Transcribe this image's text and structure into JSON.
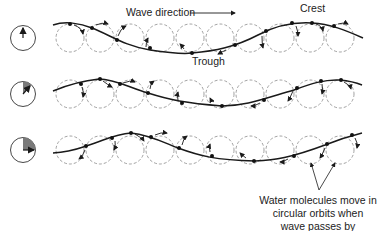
{
  "labels": {
    "wave_direction": "Wave direction",
    "crest": "Crest",
    "trough": "Trough",
    "note_line1": "Water molecules move in",
    "note_line2": "circular orbits when",
    "note_line3": "wave passes by"
  },
  "colors": {
    "line": "#1a1a1a",
    "orbit": "#8a8a8a",
    "sector_fill": "#7a7a7a"
  },
  "rows": [
    {
      "name": "time-step-1",
      "clock_sector_degrees": 0
    },
    {
      "name": "time-step-2",
      "clock_sector_degrees": 30
    },
    {
      "name": "time-step-3",
      "clock_sector_degrees": 90
    }
  ],
  "orbits_per_row": 10
}
